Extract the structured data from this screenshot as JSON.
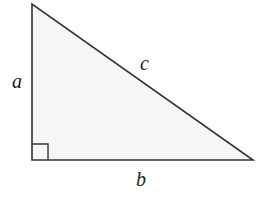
{
  "diagram": {
    "type": "right-triangle",
    "colors": {
      "stroke": "#333333",
      "fill": "#f6f6f6",
      "label": "#222222",
      "background": "#ffffff"
    },
    "vertices": {
      "top": [
        32,
        4
      ],
      "right_angle": [
        32,
        160
      ],
      "right": [
        253,
        160
      ]
    },
    "right_angle_marker": {
      "size": 16
    },
    "labels": {
      "a": {
        "text": "a",
        "x": 12,
        "y": 88,
        "side": "vertical leg"
      },
      "b": {
        "text": "b",
        "x": 136,
        "y": 186,
        "side": "horizontal leg"
      },
      "c": {
        "text": "c",
        "x": 140,
        "y": 70,
        "side": "hypotenuse"
      }
    }
  }
}
